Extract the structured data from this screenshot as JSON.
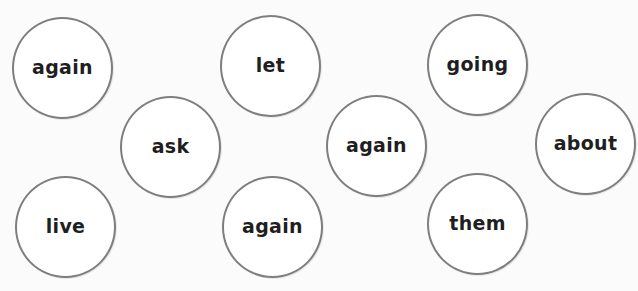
{
  "worksheet": {
    "style": {
      "circle_border": "#7e7e7e",
      "text_color": "#1f1f1f",
      "background": "#fbfbfb"
    },
    "bubbles": [
      {
        "word": "again",
        "x": 12,
        "y": 17
      },
      {
        "word": "let",
        "x": 220,
        "y": 15
      },
      {
        "word": "going",
        "x": 427,
        "y": 14
      },
      {
        "word": "ask",
        "x": 120,
        "y": 96
      },
      {
        "word": "again",
        "x": 326,
        "y": 95
      },
      {
        "word": "about",
        "x": 535,
        "y": 93
      },
      {
        "word": "live",
        "x": 15,
        "y": 176
      },
      {
        "word": "again",
        "x": 222,
        "y": 176
      },
      {
        "word": "them",
        "x": 427,
        "y": 173
      }
    ]
  }
}
